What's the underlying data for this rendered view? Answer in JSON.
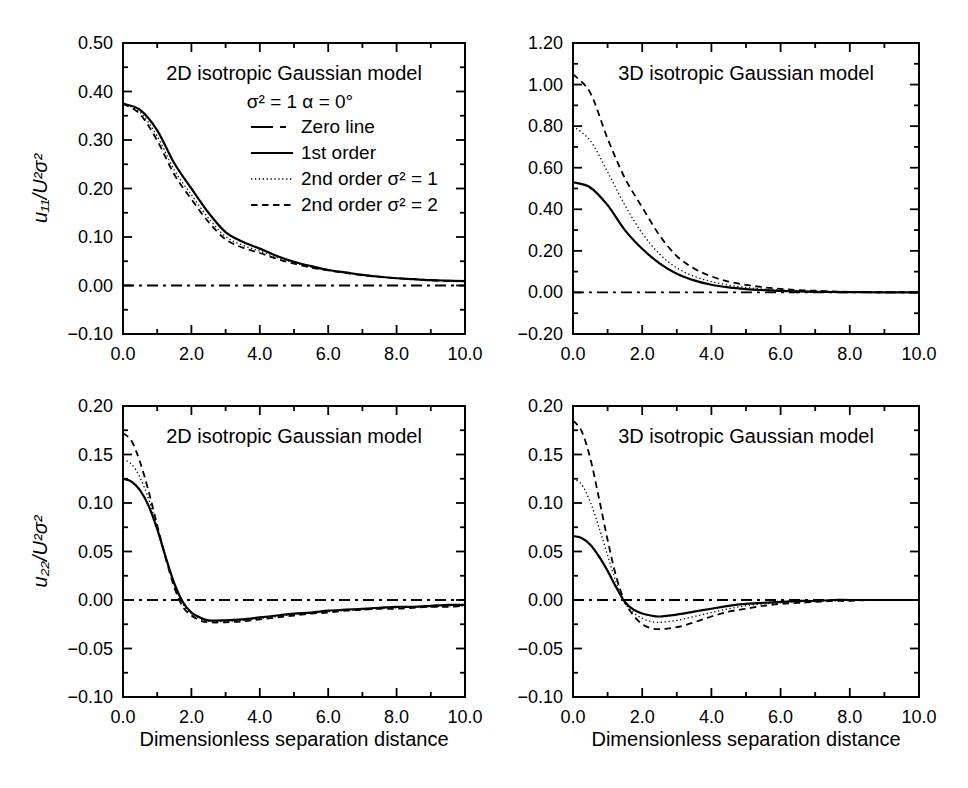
{
  "figure": {
    "background": "#ffffff",
    "ink": "#000000",
    "width": 968,
    "height": 788
  },
  "line_styles": {
    "zeroline": {
      "width": 1.8,
      "dash": "11 5 3 5"
    },
    "solid": {
      "width": 2.2,
      "dash": ""
    },
    "dotted": {
      "width": 1.3,
      "dash": "1.3 2.6"
    },
    "dashed": {
      "width": 1.8,
      "dash": "6.5 4.5"
    }
  },
  "chart_data": [
    {
      "id": "u11-2d",
      "type": "line",
      "title": "2D isotropic Gaussian model",
      "ylabel": "u₁₁/U²σ²",
      "xlabel": "",
      "xlim": [
        0,
        10
      ],
      "ylim": [
        -0.1,
        0.5
      ],
      "grid": false,
      "box": {
        "left": 123,
        "top": 43,
        "width": 342,
        "height": 291
      },
      "x_ticks": {
        "major": [
          0,
          2,
          4,
          6,
          8,
          10
        ],
        "minor": [
          1,
          3,
          5,
          7,
          9
        ],
        "labels": [
          "0.0",
          "2.0",
          "4.0",
          "6.0",
          "8.0",
          "10.0"
        ]
      },
      "y_ticks": {
        "major": [
          0.5,
          0.4,
          0.3,
          0.2,
          0.1,
          0.0,
          -0.1
        ],
        "minor": [
          0.45,
          0.35,
          0.25,
          0.15,
          0.05,
          -0.05
        ],
        "labels": [
          "0.50",
          "0.40",
          "0.30",
          "0.20",
          "0.10",
          "0.00",
          "−0.10"
        ]
      },
      "legend": {
        "header": "σ² = 1  α = 0°",
        "entries": [
          {
            "label": "Zero line",
            "style": "zeroline"
          },
          {
            "label": "1st order",
            "style": "solid"
          },
          {
            "label": "2nd order σ² = 1",
            "style": "dotted"
          },
          {
            "label": "2nd order σ² = 2",
            "style": "dashed"
          }
        ]
      },
      "series": [
        {
          "name": "Zero line",
          "key": "zero-line",
          "style": "zeroline",
          "x": [
            0,
            10
          ],
          "y": [
            0,
            0
          ]
        },
        {
          "name": "1st order",
          "key": "first-order",
          "style": "solid",
          "x": [
            0,
            0.5,
            1,
            1.5,
            2,
            2.5,
            3,
            3.5,
            4,
            4.5,
            5,
            5.5,
            6,
            6.5,
            7,
            7.5,
            8,
            8.5,
            9,
            9.5,
            10
          ],
          "y": [
            0.375,
            0.362,
            0.32,
            0.252,
            0.2,
            0.15,
            0.11,
            0.09,
            0.076,
            0.061,
            0.049,
            0.04,
            0.032,
            0.027,
            0.022,
            0.018,
            0.015,
            0.013,
            0.011,
            0.01,
            0.009
          ]
        },
        {
          "name": "2nd order σ² = 1",
          "key": "second-order-s1",
          "style": "dotted",
          "x": [
            0,
            0.5,
            1,
            1.5,
            2,
            2.5,
            3,
            3.5,
            4,
            4.5,
            5,
            5.5,
            6,
            6.5,
            7,
            7.5,
            8,
            8.5,
            9,
            9.5,
            10
          ],
          "y": [
            0.375,
            0.357,
            0.308,
            0.238,
            0.187,
            0.139,
            0.101,
            0.083,
            0.071,
            0.058,
            0.047,
            0.038,
            0.031,
            0.026,
            0.022,
            0.018,
            0.015,
            0.013,
            0.011,
            0.01,
            0.009
          ]
        },
        {
          "name": "2nd order σ² = 2",
          "key": "second-order-s2",
          "style": "dashed",
          "x": [
            0,
            0.5,
            1,
            1.5,
            2,
            2.5,
            3,
            3.5,
            4,
            4.5,
            5,
            5.5,
            6,
            6.5,
            7,
            7.5,
            8,
            8.5,
            9,
            9.5,
            10
          ],
          "y": [
            0.375,
            0.353,
            0.299,
            0.229,
            0.178,
            0.131,
            0.095,
            0.078,
            0.067,
            0.055,
            0.045,
            0.037,
            0.031,
            0.026,
            0.021,
            0.018,
            0.015,
            0.013,
            0.011,
            0.009,
            0.009
          ]
        }
      ]
    },
    {
      "id": "u11-3d",
      "type": "line",
      "title": "3D isotropic Gaussian model",
      "ylabel": "",
      "xlabel": "",
      "xlim": [
        0,
        10
      ],
      "ylim": [
        -0.2,
        1.2
      ],
      "grid": false,
      "box": {
        "left": 573,
        "top": 43,
        "width": 346,
        "height": 291
      },
      "x_ticks": {
        "major": [
          0,
          2,
          4,
          6,
          8,
          10
        ],
        "minor": [
          1,
          3,
          5,
          7,
          9
        ],
        "labels": [
          "0.0",
          "2.0",
          "4.0",
          "6.0",
          "8.0",
          "10.0"
        ]
      },
      "y_ticks": {
        "major": [
          1.2,
          1.0,
          0.8,
          0.6,
          0.4,
          0.2,
          0.0,
          -0.2
        ],
        "minor": [
          1.1,
          0.9,
          0.7,
          0.5,
          0.3,
          0.1,
          -0.1
        ],
        "labels": [
          "1.20",
          "1.00",
          "0.80",
          "0.60",
          "0.40",
          "0.20",
          "0.00",
          "−0.20"
        ]
      },
      "legend": null,
      "series": [
        {
          "name": "Zero line",
          "key": "zero-line",
          "style": "zeroline",
          "x": [
            0,
            10
          ],
          "y": [
            0,
            0
          ]
        },
        {
          "name": "1st order",
          "key": "first-order",
          "style": "solid",
          "x": [
            0,
            0.5,
            1,
            1.5,
            2,
            2.5,
            3,
            3.5,
            4,
            4.5,
            5,
            5.5,
            6,
            6.5,
            7,
            7.5,
            8,
            8.5,
            9,
            9.5,
            10
          ],
          "y": [
            0.53,
            0.505,
            0.42,
            0.3,
            0.21,
            0.14,
            0.09,
            0.058,
            0.037,
            0.024,
            0.016,
            0.011,
            0.007,
            0.005,
            0.003,
            0.002,
            0.001,
            0.001,
            0.0,
            0.0,
            0.0
          ]
        },
        {
          "name": "2nd order σ² = 1",
          "key": "second-order-s1",
          "style": "dotted",
          "x": [
            0,
            0.5,
            1,
            1.5,
            2,
            2.5,
            3,
            3.5,
            4,
            4.5,
            5,
            5.5,
            6,
            6.5,
            7,
            7.5,
            8,
            8.5,
            9,
            9.5,
            10
          ],
          "y": [
            0.8,
            0.73,
            0.58,
            0.42,
            0.285,
            0.185,
            0.118,
            0.078,
            0.052,
            0.035,
            0.024,
            0.016,
            0.011,
            0.007,
            0.005,
            0.003,
            0.002,
            0.001,
            0.001,
            0.0,
            0.0
          ]
        },
        {
          "name": "2nd order σ² = 2",
          "key": "second-order-s2",
          "style": "dashed",
          "x": [
            0,
            0.5,
            1,
            1.5,
            2,
            2.5,
            3,
            3.5,
            4,
            4.5,
            5,
            5.5,
            6,
            6.5,
            7,
            7.5,
            8,
            8.5,
            9,
            9.5,
            10
          ],
          "y": [
            1.05,
            0.96,
            0.74,
            0.55,
            0.41,
            0.275,
            0.175,
            0.115,
            0.077,
            0.052,
            0.036,
            0.025,
            0.017,
            0.011,
            0.008,
            0.005,
            0.003,
            0.002,
            0.001,
            0.001,
            0.0
          ]
        }
      ]
    },
    {
      "id": "u22-2d",
      "type": "line",
      "title": "2D isotropic Gaussian model",
      "ylabel": "u₂₂/U²σ²",
      "xlabel": "Dimensionless separation distance",
      "xlim": [
        0,
        10
      ],
      "ylim": [
        -0.1,
        0.2
      ],
      "grid": false,
      "box": {
        "left": 123,
        "top": 406,
        "width": 342,
        "height": 291
      },
      "x_ticks": {
        "major": [
          0,
          2,
          4,
          6,
          8,
          10
        ],
        "minor": [
          1,
          3,
          5,
          7,
          9
        ],
        "labels": [
          "0.0",
          "2.0",
          "4.0",
          "6.0",
          "8.0",
          "10.0"
        ]
      },
      "y_ticks": {
        "major": [
          0.2,
          0.15,
          0.1,
          0.05,
          0.0,
          -0.05,
          -0.1
        ],
        "minor": [
          0.175,
          0.125,
          0.075,
          0.025,
          -0.025,
          -0.075
        ],
        "labels": [
          "0.20",
          "0.15",
          "0.10",
          "0.05",
          "0.00",
          "−0.05",
          "−0.10"
        ]
      },
      "legend": null,
      "series": [
        {
          "name": "Zero line",
          "key": "zero-line",
          "style": "zeroline",
          "x": [
            0,
            10
          ],
          "y": [
            0,
            0
          ]
        },
        {
          "name": "1st order",
          "key": "first-order",
          "style": "solid",
          "x": [
            0,
            0.25,
            0.5,
            0.75,
            1,
            1.25,
            1.5,
            1.75,
            2,
            2.25,
            2.5,
            3,
            3.5,
            4,
            4.5,
            5,
            5.5,
            6,
            6.5,
            7,
            7.5,
            8,
            8.5,
            9,
            9.5,
            10
          ],
          "y": [
            0.125,
            0.122,
            0.113,
            0.097,
            0.073,
            0.044,
            0.017,
            -0.002,
            -0.013,
            -0.018,
            -0.021,
            -0.021,
            -0.02,
            -0.018,
            -0.016,
            -0.014,
            -0.013,
            -0.011,
            -0.01,
            -0.009,
            -0.008,
            -0.007,
            -0.007,
            -0.006,
            -0.005,
            -0.005
          ]
        },
        {
          "name": "2nd order σ² = 1",
          "key": "second-order-s1",
          "style": "dotted",
          "x": [
            0,
            0.25,
            0.5,
            0.75,
            1,
            1.25,
            1.5,
            1.75,
            2,
            2.25,
            2.5,
            3,
            3.5,
            4,
            4.5,
            5,
            5.5,
            6,
            6.5,
            7,
            7.5,
            8,
            8.5,
            9,
            9.5,
            10
          ],
          "y": [
            0.145,
            0.14,
            0.126,
            0.104,
            0.075,
            0.044,
            0.016,
            -0.004,
            -0.014,
            -0.019,
            -0.022,
            -0.022,
            -0.021,
            -0.019,
            -0.017,
            -0.015,
            -0.013,
            -0.012,
            -0.011,
            -0.01,
            -0.009,
            -0.008,
            -0.007,
            -0.007,
            -0.006,
            -0.006
          ]
        },
        {
          "name": "2nd order σ² = 2",
          "key": "second-order-s2",
          "style": "dashed",
          "x": [
            0,
            0.25,
            0.5,
            0.75,
            1,
            1.25,
            1.5,
            1.75,
            2,
            2.25,
            2.5,
            3,
            3.5,
            4,
            4.5,
            5,
            5.5,
            6,
            6.5,
            7,
            7.5,
            8,
            8.5,
            9,
            9.5,
            10
          ],
          "y": [
            0.172,
            0.164,
            0.142,
            0.112,
            0.077,
            0.043,
            0.013,
            -0.007,
            -0.016,
            -0.021,
            -0.023,
            -0.023,
            -0.022,
            -0.02,
            -0.018,
            -0.016,
            -0.014,
            -0.013,
            -0.011,
            -0.01,
            -0.009,
            -0.009,
            -0.008,
            -0.007,
            -0.007,
            -0.006
          ]
        }
      ]
    },
    {
      "id": "u22-3d",
      "type": "line",
      "title": "3D isotropic Gaussian model",
      "ylabel": "",
      "xlabel": "Dimensionless separation distance",
      "xlim": [
        0,
        10
      ],
      "ylim": [
        -0.1,
        0.2
      ],
      "grid": false,
      "box": {
        "left": 573,
        "top": 406,
        "width": 346,
        "height": 291
      },
      "x_ticks": {
        "major": [
          0,
          2,
          4,
          6,
          8,
          10
        ],
        "minor": [
          1,
          3,
          5,
          7,
          9
        ],
        "labels": [
          "0.0",
          "2.0",
          "4.0",
          "6.0",
          "8.0",
          "10.0"
        ]
      },
      "y_ticks": {
        "major": [
          0.2,
          0.15,
          0.1,
          0.05,
          0.0,
          -0.05,
          -0.1
        ],
        "minor": [
          0.175,
          0.125,
          0.075,
          0.025,
          -0.025,
          -0.075
        ],
        "labels": [
          "0.20",
          "0.15",
          "0.10",
          "0.05",
          "0.00",
          "−0.05",
          "−0.10"
        ]
      },
      "legend": null,
      "series": [
        {
          "name": "Zero line",
          "key": "zero-line",
          "style": "zeroline",
          "x": [
            0,
            10
          ],
          "y": [
            0,
            0
          ]
        },
        {
          "name": "1st order",
          "key": "first-order",
          "style": "solid",
          "x": [
            0,
            0.25,
            0.5,
            0.75,
            1,
            1.25,
            1.5,
            1.75,
            2,
            2.25,
            2.5,
            3,
            3.5,
            4,
            4.5,
            5,
            5.5,
            6,
            6.5,
            7,
            7.5,
            8,
            8.5,
            9,
            9.5,
            10
          ],
          "y": [
            0.066,
            0.064,
            0.057,
            0.045,
            0.03,
            0.013,
            -0.002,
            -0.01,
            -0.014,
            -0.016,
            -0.017,
            -0.015,
            -0.012,
            -0.009,
            -0.006,
            -0.004,
            -0.003,
            -0.002,
            -0.001,
            -0.001,
            0.0,
            0.0,
            0.0,
            0.0,
            0.0,
            0.0
          ]
        },
        {
          "name": "2nd order σ² = 1",
          "key": "second-order-s1",
          "style": "dotted",
          "x": [
            0,
            0.25,
            0.5,
            0.75,
            1,
            1.25,
            1.5,
            1.75,
            2,
            2.25,
            2.5,
            3,
            3.5,
            4,
            4.5,
            5,
            5.5,
            6,
            6.5,
            7,
            7.5,
            8,
            8.5,
            9,
            9.5,
            10
          ],
          "y": [
            0.125,
            0.119,
            0.101,
            0.075,
            0.046,
            0.018,
            -0.003,
            -0.013,
            -0.019,
            -0.022,
            -0.023,
            -0.021,
            -0.017,
            -0.013,
            -0.009,
            -0.006,
            -0.004,
            -0.003,
            -0.002,
            -0.001,
            -0.001,
            0.0,
            0.0,
            0.0,
            0.0,
            0.0
          ]
        },
        {
          "name": "2nd order σ² = 2",
          "key": "second-order-s2",
          "style": "dashed",
          "x": [
            0,
            0.25,
            0.5,
            0.75,
            1,
            1.25,
            1.5,
            1.75,
            2,
            2.25,
            2.5,
            3,
            3.5,
            4,
            4.5,
            5,
            5.5,
            6,
            6.5,
            7,
            7.5,
            8,
            8.5,
            9,
            9.5,
            10
          ],
          "y": [
            0.185,
            0.174,
            0.146,
            0.105,
            0.062,
            0.024,
            -0.002,
            -0.016,
            -0.025,
            -0.029,
            -0.03,
            -0.028,
            -0.023,
            -0.017,
            -0.012,
            -0.009,
            -0.006,
            -0.004,
            -0.003,
            -0.002,
            -0.001,
            -0.001,
            0.0,
            0.0,
            0.0,
            0.0
          ]
        }
      ]
    }
  ]
}
